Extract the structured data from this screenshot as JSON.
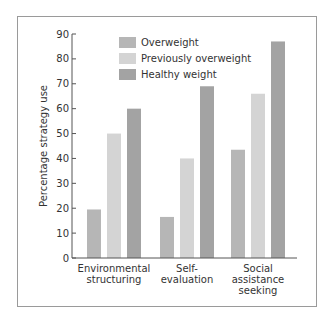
{
  "chart_data": {
    "type": "bar",
    "title": "",
    "xlabel": "",
    "ylabel": "Percentage strategy use",
    "ylim": [
      0,
      90
    ],
    "yticks": [
      0,
      10,
      20,
      30,
      40,
      50,
      60,
      70,
      80,
      90
    ],
    "grid": false,
    "legend_position": "top-center (inside plot)",
    "categories": [
      "Environmental structuring",
      "Self-evaluation",
      "Social assistance seeking"
    ],
    "category_label_lines": [
      [
        "Environmental",
        "structuring"
      ],
      [
        "Self-",
        "evaluation"
      ],
      [
        "Social",
        "assistance",
        "seeking"
      ]
    ],
    "series": [
      {
        "name": "Overweight",
        "color": "#b6b6b6",
        "values": [
          19.5,
          16.5,
          43.5
        ]
      },
      {
        "name": "Previously overweight",
        "color": "#d4d4d4",
        "values": [
          50,
          40,
          66
        ]
      },
      {
        "name": "Healthy weight",
        "color": "#a3a3a3",
        "values": [
          60,
          69,
          87
        ]
      }
    ]
  }
}
